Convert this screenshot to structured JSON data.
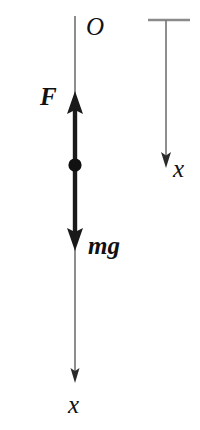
{
  "figure": {
    "width": 200,
    "height": 430,
    "background_color": "#ffffff"
  },
  "colors": {
    "axis_line": "#7a7a7a",
    "vector_stroke": "#1a1a1a",
    "particle_fill": "#111111",
    "label_text": "#111111"
  },
  "labels": {
    "origin": "O",
    "force": "F",
    "weight": "mg",
    "axis_left": "x",
    "axis_right": "x"
  },
  "diagram_data": {
    "type": "free-body-diagram",
    "axes": [
      {
        "name": "left-axis",
        "orientation": "vertical",
        "direction": "downward-positive",
        "origin_label": "O",
        "origin_point": [
          75,
          16
        ],
        "end_point": [
          75,
          382
        ],
        "arrow_at": "bottom",
        "axis_label": "x",
        "has_top_tick": false
      },
      {
        "name": "right-axis",
        "orientation": "vertical",
        "direction": "downward-positive",
        "origin_point": [
          166,
          20
        ],
        "end_point": [
          166,
          166
        ],
        "arrow_at": "bottom",
        "axis_label": "x",
        "has_top_tick": true,
        "top_tick_span": [
          148,
          190
        ]
      }
    ],
    "particle": {
      "name": "point-mass",
      "center": [
        75,
        165
      ],
      "radius": 6.5,
      "filled": true
    },
    "vectors": [
      {
        "name": "force",
        "label": "F",
        "from": [
          75,
          165
        ],
        "to": [
          75,
          92
        ],
        "direction": "up",
        "style": "bold-arrow",
        "label_position": "left"
      },
      {
        "name": "weight",
        "label": "mg",
        "from": [
          75,
          165
        ],
        "to": [
          75,
          250
        ],
        "direction": "down",
        "style": "bold-arrow",
        "label_position": "right"
      }
    ]
  }
}
